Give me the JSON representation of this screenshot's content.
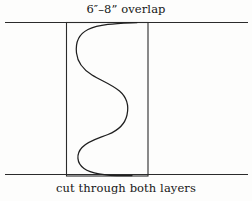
{
  "diagram": {
    "title_label": "6″–8” overlap",
    "caption_label": "cut through both layers",
    "colors": {
      "background": "#fdfdfc",
      "line": "#2b2b2b",
      "curve": "#1f1f1f",
      "text": "#161616"
    },
    "elements": {
      "top_seam_line_name": "top fabric edge line",
      "bottom_seam_line_name": "bottom fabric edge line",
      "overlap_rectangle_name": "overlap region rectangle",
      "wavy_cut_line_name": "wavy cut line"
    },
    "geometry": {
      "canvas": [
        252,
        201
      ],
      "top_line_y": 22,
      "bottom_line_y": 174,
      "line_x_start": 5,
      "line_x_end": 248,
      "rect_left": 66,
      "rect_right": 148,
      "rect_top": 22,
      "rect_bottom": 176,
      "curve_points": [
        [
          135,
          23
        ],
        [
          95,
          26
        ],
        [
          78,
          45
        ],
        [
          79,
          68
        ],
        [
          110,
          82
        ],
        [
          127,
          96
        ],
        [
          122,
          125
        ],
        [
          92,
          135
        ],
        [
          78,
          148
        ],
        [
          82,
          165
        ],
        [
          112,
          174
        ],
        [
          131,
          175
        ]
      ]
    }
  }
}
